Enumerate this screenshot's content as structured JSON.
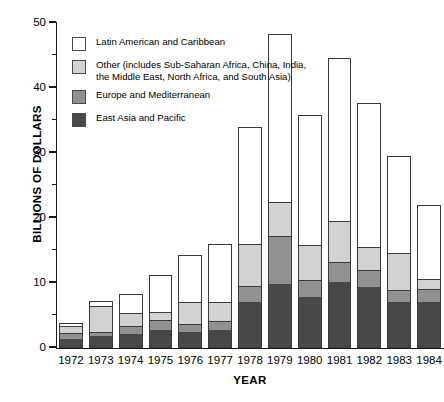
{
  "chart_data": {
    "type": "bar",
    "subtype": "stacked-vertical",
    "title": "",
    "xlabel": "YEAR",
    "ylabel": "BILLIONS OF DOLLARS",
    "ylim": [
      0,
      50
    ],
    "ytick_step": 10,
    "yminor_step": 5,
    "grid": false,
    "legend_position": "inside-top-left",
    "categories": [
      "1972",
      "1973",
      "1974",
      "1975",
      "1976",
      "1977",
      "1978",
      "1979",
      "1980",
      "1981",
      "1982",
      "1983",
      "1984"
    ],
    "ytick_labels": [
      "0",
      "10",
      "20",
      "30",
      "40",
      "50"
    ],
    "series": [
      {
        "name": "East Asia and Pacific",
        "color": "#484848",
        "values": [
          1.2,
          1.6,
          2.0,
          2.6,
          2.3,
          2.6,
          6.9,
          9.6,
          7.6,
          9.9,
          9.2,
          6.8,
          6.9
        ]
      },
      {
        "name": "Europe and Mediterranean",
        "color": "#919191",
        "values": [
          0.9,
          0.7,
          1.2,
          1.5,
          1.2,
          1.3,
          2.4,
          7.4,
          2.6,
          3.1,
          2.6,
          1.9,
          1.9
        ]
      },
      {
        "name": "Other (includes Sub-Saharan Africa, China, India, the Middle East, North Africa, and South Asia)",
        "color": "#d2d2d2",
        "values": [
          1.0,
          3.9,
          2.0,
          1.3,
          3.3,
          2.9,
          6.5,
          5.3,
          5.5,
          6.3,
          3.6,
          5.7,
          1.6
        ]
      },
      {
        "name": "Latin American and Caribbean",
        "color": "#ffffff",
        "values": [
          0.7,
          1.0,
          3.0,
          5.7,
          7.4,
          9.2,
          18.2,
          26.0,
          20.1,
          25.3,
          22.2,
          15.1,
          11.6
        ]
      }
    ],
    "totals": [
      3.8,
      7.2,
      8.2,
      11.1,
      14.2,
      16.0,
      34.0,
      48.3,
      35.8,
      44.6,
      37.6,
      29.5,
      22.0
    ]
  },
  "legend": {
    "entries": [
      {
        "swatch": "white-swatch",
        "label": "Latin American and Caribbean"
      },
      {
        "swatch": "light-gray-swatch",
        "label": "Other (includes Sub-Saharan Africa, China, India, the Middle East, North Africa, and South Asia)"
      },
      {
        "swatch": "medium-gray-swatch",
        "label": "Europe and Mediterranean"
      },
      {
        "swatch": "dark-gray-swatch",
        "label": "East Asia and Pacific"
      }
    ]
  },
  "axes": {
    "y_title": "BILLIONS OF DOLLARS",
    "x_title": "YEAR"
  }
}
